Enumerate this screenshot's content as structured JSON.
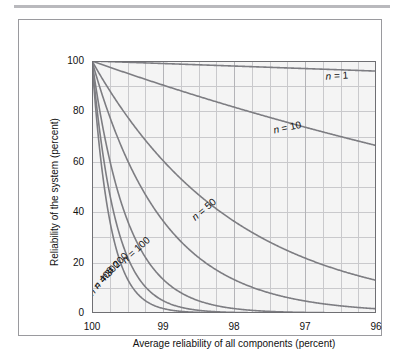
{
  "figure": {
    "frame_color": "#9a9a9e",
    "background": "#ffffff",
    "top_rule_color": "#b9b9bd"
  },
  "chart_data": {
    "type": "line",
    "title": "",
    "subtitle": "",
    "xlabel": "Average reliability of all components (percent)",
    "ylabel": "Reliability of the system (percent)",
    "xlim": [
      100,
      96
    ],
    "ylim": [
      0,
      100
    ],
    "x_reversed": true,
    "grid": true,
    "grid_color": "#c9c9cc",
    "plot_background": "#f4f4f4",
    "curve_color": "#7d7d82",
    "legend_position": "inline-labels",
    "x_ticks": [
      100,
      99,
      98,
      97,
      96
    ],
    "x_tick_labels": [
      "100",
      "99",
      "98",
      "97",
      "96"
    ],
    "x_minor_step": 0.25,
    "y_ticks": [
      0,
      20,
      40,
      60,
      80,
      100
    ],
    "y_tick_labels": [
      "0",
      "20",
      "40",
      "60",
      "80",
      "100"
    ],
    "y_minor_step": 10,
    "formula": "R = p^n",
    "series": [
      {
        "name": "n = 1",
        "n": 1,
        "label": "n = 1",
        "label_x": 96.55,
        "label_y": 94.0,
        "label_rotation": -3,
        "x": [
          100,
          99.5,
          99,
          98.5,
          98,
          97.5,
          97,
          96.5,
          96
        ],
        "values": [
          100.0,
          99.5,
          99.0,
          98.5,
          98.0,
          97.5,
          97.0,
          96.5,
          96.0
        ]
      },
      {
        "name": "n = 10",
        "n": 10,
        "label": "n = 10",
        "label_x": 97.25,
        "label_y": 73.5,
        "label_rotation": -12,
        "x": [
          100,
          99.5,
          99,
          98.5,
          98,
          97.5,
          97,
          96.5,
          96
        ],
        "values": [
          100.0,
          95.1,
          90.4,
          86.0,
          81.7,
          77.6,
          73.7,
          70.0,
          66.5
        ]
      },
      {
        "name": "n = 50",
        "n": 50,
        "label": "n = 50",
        "label_x": 98.42,
        "label_y": 41.0,
        "label_rotation": -40,
        "x": [
          100,
          99.75,
          99.5,
          99.25,
          99,
          98.5,
          98,
          97.5,
          97,
          96.5,
          96
        ],
        "values": [
          100.0,
          88.2,
          77.8,
          68.6,
          60.5,
          46.9,
          36.4,
          28.1,
          21.8,
          16.8,
          13.0
        ]
      },
      {
        "name": "n = 100",
        "n": 100,
        "label": "n = 100",
        "label_x": 99.38,
        "label_y": 25.0,
        "label_rotation": -42,
        "x": [
          100,
          99.75,
          99.5,
          99.25,
          99,
          98.5,
          98,
          97.5,
          97,
          96.5,
          96
        ],
        "values": [
          100.0,
          77.9,
          60.6,
          47.1,
          36.6,
          22.0,
          13.3,
          7.9,
          4.8,
          2.8,
          1.7
        ]
      },
      {
        "name": "n = 200",
        "n": 200,
        "label": "n = 200",
        "label_x": 99.68,
        "label_y": 18.5,
        "label_rotation": -45,
        "x": [
          100,
          99.75,
          99.5,
          99.25,
          99,
          98.5,
          98,
          97.5,
          97,
          96.5,
          96
        ],
        "values": [
          100.0,
          60.6,
          36.7,
          22.2,
          13.4,
          4.9,
          1.8,
          0.6,
          0.2,
          0.1,
          0.0
        ]
      },
      {
        "name": "n = 300",
        "n": 300,
        "label": "n = 300",
        "label_x": 99.79,
        "label_y": 15.0,
        "label_rotation": -47,
        "x": [
          100,
          99.75,
          99.5,
          99.25,
          99,
          98.5,
          98,
          97.5,
          97,
          96.5,
          96
        ],
        "values": [
          100.0,
          47.2,
          22.2,
          10.5,
          4.9,
          1.1,
          0.2,
          0.05,
          0.0,
          0.0,
          0.0
        ]
      },
      {
        "name": "n = 400",
        "n": 400,
        "label": "n = 400",
        "label_x": 99.87,
        "label_y": 12.5,
        "label_rotation": -50,
        "x": [
          100,
          99.75,
          99.5,
          99.25,
          99,
          98.5,
          98,
          97.5,
          97,
          96.5,
          96
        ],
        "values": [
          100.0,
          36.7,
          13.4,
          4.9,
          1.8,
          0.24,
          0.03,
          0.0,
          0.0,
          0.0,
          0.0
        ]
      }
    ]
  }
}
